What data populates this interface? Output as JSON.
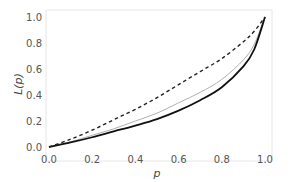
{
  "chart_data": {
    "type": "line",
    "title": "",
    "xlabel": "p",
    "ylabel": "L(p)",
    "xlim": [
      0,
      1
    ],
    "ylim": [
      0,
      1
    ],
    "grid": false,
    "legend": null,
    "xticks": [
      "0.0",
      "0.2",
      "0.4",
      "0.6",
      "0.8",
      "1.0"
    ],
    "yticks": [
      "0.0",
      "0.2",
      "0.4",
      "0.6",
      "0.8",
      "1.0"
    ],
    "x": [
      0.0,
      0.1,
      0.2,
      0.3,
      0.4,
      0.5,
      0.6,
      0.7,
      0.8,
      0.9,
      0.95,
      1.0
    ],
    "series": [
      {
        "name": "dashed",
        "style": "dashed",
        "color": "#222222",
        "values": [
          0.0,
          0.06,
          0.13,
          0.21,
          0.29,
          0.38,
          0.48,
          0.58,
          0.68,
          0.81,
          0.89,
          1.0
        ]
      },
      {
        "name": "gray",
        "style": "solid",
        "color": "#b0b0b0",
        "values": [
          0.0,
          0.04,
          0.09,
          0.14,
          0.2,
          0.26,
          0.34,
          0.42,
          0.52,
          0.67,
          0.79,
          1.0
        ]
      },
      {
        "name": "black",
        "style": "solid",
        "color": "#111111",
        "values": [
          0.0,
          0.035,
          0.075,
          0.12,
          0.165,
          0.215,
          0.28,
          0.36,
          0.46,
          0.62,
          0.75,
          1.0
        ]
      }
    ]
  }
}
